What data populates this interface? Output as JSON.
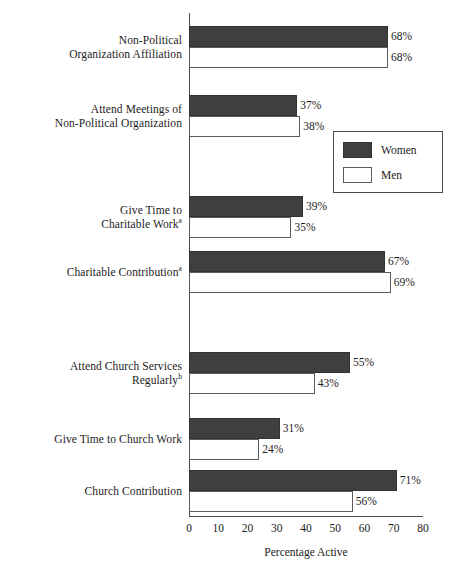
{
  "chart_data": {
    "type": "bar",
    "orientation": "horizontal",
    "title": "",
    "xlabel": "Percentage Active",
    "ylabel": "",
    "xlim": [
      0,
      80
    ],
    "xticks": [
      0,
      10,
      20,
      30,
      40,
      50,
      60,
      70,
      80
    ],
    "grid": false,
    "legend": {
      "position": "upper-right-inset",
      "entries": [
        {
          "name": "Women",
          "color": "#403f3f",
          "style": "filled"
        },
        {
          "name": "Men",
          "color": "#ffffff",
          "style": "outlined"
        }
      ]
    },
    "categories": [
      "Non-Political\nOrganization Affiliation",
      "Attend Meetings of\nNon-Political Organization",
      "Give Time to\nCharitable Work",
      "Charitable Contribution",
      "Attend Church Services\nRegularly",
      "Give Time to Church Work",
      "Church Contribution"
    ],
    "category_footnotes": [
      "",
      "",
      "a",
      "a",
      "b",
      "",
      ""
    ],
    "series": [
      {
        "name": "Women",
        "values": [
          68,
          37,
          39,
          67,
          55,
          31,
          71
        ]
      },
      {
        "name": "Men",
        "values": [
          68,
          38,
          35,
          69,
          43,
          24,
          56
        ]
      }
    ],
    "value_labels": {
      "Women": [
        "68%",
        "37%",
        "39%",
        "67%",
        "55%",
        "31%",
        "71%"
      ],
      "Men": [
        "68%",
        "38%",
        "35%",
        "69%",
        "43%",
        "24%",
        "56%"
      ]
    }
  },
  "axis": {
    "tick_labels": [
      "0",
      "10",
      "20",
      "30",
      "40",
      "50",
      "60",
      "70",
      "80"
    ],
    "title": "Percentage Active"
  }
}
